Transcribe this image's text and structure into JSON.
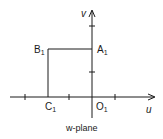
{
  "diagram": {
    "caption": "w-plane",
    "axes": {
      "horizontal_label": "u",
      "vertical_label": "v"
    },
    "points": {
      "A": {
        "name": "A",
        "sub": "1"
      },
      "B": {
        "name": "B",
        "sub": "1"
      },
      "C": {
        "name": "C",
        "sub": "1"
      },
      "O": {
        "name": "O",
        "sub": "1"
      }
    },
    "colors": {
      "ink": "#1a1a1a",
      "background": "#ffffff"
    }
  }
}
